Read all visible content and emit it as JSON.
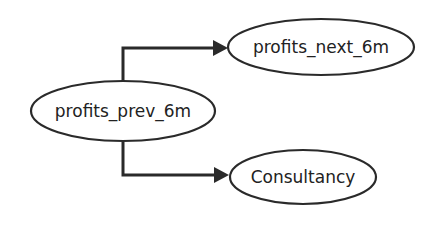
{
  "diagram": {
    "type": "directed-graph",
    "nodes": [
      {
        "id": "profits_prev_6m",
        "label": "profits_prev_6m"
      },
      {
        "id": "profits_next_6m",
        "label": "profits_next_6m"
      },
      {
        "id": "Consultancy",
        "label": "Consultancy"
      }
    ],
    "edges": [
      {
        "from": "profits_prev_6m",
        "to": "profits_next_6m"
      },
      {
        "from": "profits_prev_6m",
        "to": "Consultancy"
      }
    ],
    "colors": {
      "stroke": "#2a2a2a",
      "background": "#ffffff"
    }
  }
}
